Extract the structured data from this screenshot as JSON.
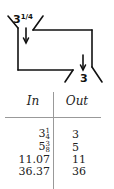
{
  "diagram": {
    "input_label_whole": "3",
    "input_label_frac": "1/4",
    "output_label": "3"
  },
  "table": {
    "headers": {
      "in": "In",
      "out": "Out"
    },
    "rows": [
      {
        "in_whole": "3",
        "in_num": "1",
        "in_den": "4",
        "in": "3 1/4",
        "out": "3"
      },
      {
        "in_whole": "5",
        "in_num": "3",
        "in_den": "8",
        "in": "5 3/8",
        "out": "5"
      },
      {
        "in": "11.07",
        "out": "11"
      },
      {
        "in": "36.37",
        "out": "36"
      }
    ]
  }
}
